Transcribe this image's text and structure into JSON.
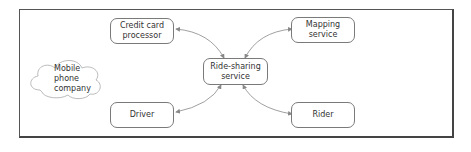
{
  "diagram": {
    "nodes": {
      "credit_card": "Credit card\nprocessor",
      "mapping": "Mapping\nservice",
      "ride_sharing": "Ride-sharing\nservice",
      "driver": "Driver",
      "rider": "Rider",
      "mobile_phone": "Mobile\nphone\ncompany"
    },
    "edges": [
      {
        "from": "ride_sharing",
        "to": "credit_card",
        "bidirectional": true
      },
      {
        "from": "ride_sharing",
        "to": "mapping",
        "bidirectional": true
      },
      {
        "from": "ride_sharing",
        "to": "driver",
        "bidirectional": true
      },
      {
        "from": "ride_sharing",
        "to": "rider",
        "bidirectional": true
      }
    ]
  }
}
